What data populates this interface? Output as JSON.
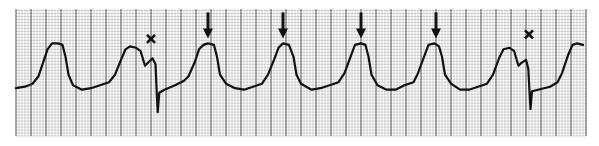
{
  "chart_data": {
    "type": "line",
    "title": "",
    "subtitle": "",
    "xlabel": "",
    "ylabel": "",
    "grid": true,
    "legend": "none",
    "colors": {
      "trace": "#111111",
      "grid_major": "#3a3a3a",
      "grid_minor": "#9a9a9a",
      "paper": "#ffffff"
    },
    "x_unit": "strip position (large boxes)",
    "y_unit": "amplitude (large boxes, baseline = 0)",
    "xlim": [
      0,
      38
    ],
    "ylim": [
      -3.5,
      5
    ],
    "series": [
      {
        "name": "ECG trace",
        "points": [
          [
            0.0,
            -0.3
          ],
          [
            0.6,
            -0.2
          ],
          [
            1.1,
            0.0
          ],
          [
            1.5,
            0.5
          ],
          [
            1.8,
            1.4
          ],
          [
            2.1,
            2.3
          ],
          [
            2.4,
            2.7
          ],
          [
            2.8,
            2.7
          ],
          [
            3.1,
            2.6
          ],
          [
            3.3,
            1.8
          ],
          [
            3.5,
            0.6
          ],
          [
            3.8,
            -0.1
          ],
          [
            4.4,
            -0.4
          ],
          [
            5.0,
            -0.3
          ],
          [
            5.6,
            -0.1
          ],
          [
            6.2,
            0.1
          ],
          [
            6.6,
            0.6
          ],
          [
            7.0,
            1.6
          ],
          [
            7.3,
            2.3
          ],
          [
            7.6,
            2.5
          ],
          [
            8.0,
            2.4
          ],
          [
            8.3,
            2.2
          ],
          [
            8.6,
            1.2
          ],
          [
            8.8,
            1.4
          ],
          [
            9.1,
            1.7
          ],
          [
            9.3,
            1.3
          ],
          [
            9.4,
            -1.0
          ],
          [
            9.45,
            -1.9
          ],
          [
            9.55,
            -0.6
          ],
          [
            9.9,
            -0.4
          ],
          [
            10.6,
            -0.1
          ],
          [
            11.2,
            0.2
          ],
          [
            11.5,
            0.5
          ],
          [
            11.9,
            1.4
          ],
          [
            12.2,
            2.3
          ],
          [
            12.5,
            2.6
          ],
          [
            12.8,
            2.7
          ],
          [
            13.2,
            2.6
          ],
          [
            13.4,
            1.8
          ],
          [
            13.6,
            0.6
          ],
          [
            14.0,
            0.0
          ],
          [
            14.6,
            -0.3
          ],
          [
            15.2,
            -0.4
          ],
          [
            15.8,
            -0.2
          ],
          [
            16.4,
            0.0
          ],
          [
            16.8,
            0.6
          ],
          [
            17.2,
            1.6
          ],
          [
            17.5,
            2.4
          ],
          [
            17.8,
            2.7
          ],
          [
            18.2,
            2.6
          ],
          [
            18.5,
            1.8
          ],
          [
            18.7,
            0.6
          ],
          [
            19.0,
            0.0
          ],
          [
            19.7,
            -0.4
          ],
          [
            20.3,
            -0.3
          ],
          [
            20.9,
            -0.1
          ],
          [
            21.5,
            0.1
          ],
          [
            21.9,
            0.7
          ],
          [
            22.3,
            1.8
          ],
          [
            22.6,
            2.6
          ],
          [
            23.0,
            2.7
          ],
          [
            23.3,
            2.6
          ],
          [
            23.5,
            1.8
          ],
          [
            23.7,
            0.6
          ],
          [
            24.1,
            -0.1
          ],
          [
            24.7,
            -0.4
          ],
          [
            25.3,
            -0.4
          ],
          [
            25.9,
            -0.1
          ],
          [
            26.5,
            0.1
          ],
          [
            26.8,
            0.7
          ],
          [
            27.2,
            1.8
          ],
          [
            27.5,
            2.6
          ],
          [
            27.9,
            2.7
          ],
          [
            28.2,
            2.5
          ],
          [
            28.4,
            1.8
          ],
          [
            28.6,
            0.6
          ],
          [
            29.0,
            0.0
          ],
          [
            29.6,
            -0.4
          ],
          [
            30.2,
            -0.4
          ],
          [
            30.8,
            -0.2
          ],
          [
            31.4,
            0.0
          ],
          [
            31.8,
            0.6
          ],
          [
            32.2,
            1.7
          ],
          [
            32.5,
            2.3
          ],
          [
            32.9,
            2.4
          ],
          [
            33.2,
            2.2
          ],
          [
            33.5,
            1.2
          ],
          [
            33.7,
            1.4
          ],
          [
            34.0,
            1.6
          ],
          [
            34.15,
            1.0
          ],
          [
            34.25,
            -0.9
          ],
          [
            34.3,
            -1.7
          ],
          [
            34.4,
            -0.5
          ],
          [
            34.8,
            -0.4
          ],
          [
            35.6,
            -0.2
          ],
          [
            36.1,
            0.1
          ],
          [
            36.4,
            0.7
          ],
          [
            36.8,
            1.9
          ],
          [
            37.1,
            2.6
          ],
          [
            37.4,
            2.7
          ],
          [
            37.8,
            2.6
          ]
        ]
      }
    ],
    "annotations": [
      {
        "type": "x-mark",
        "label": "✕",
        "x": 9.0,
        "y": 3.0
      },
      {
        "type": "arrow",
        "label": "↓",
        "x": 12.8,
        "y": 2.9
      },
      {
        "type": "arrow",
        "label": "↓",
        "x": 17.8,
        "y": 2.9
      },
      {
        "type": "arrow",
        "label": "↓",
        "x": 23.0,
        "y": 2.9
      },
      {
        "type": "arrow",
        "label": "↓",
        "x": 28.0,
        "y": 2.9
      },
      {
        "type": "x-mark",
        "label": "✕",
        "x": 34.2,
        "y": 3.3
      }
    ]
  }
}
